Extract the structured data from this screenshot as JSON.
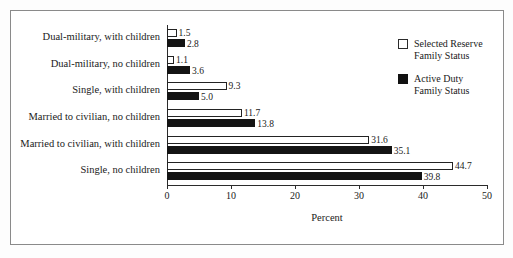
{
  "chart_data": {
    "type": "bar",
    "orientation": "horizontal",
    "title": "",
    "xlabel": "Percent",
    "ylabel": "",
    "xlim": [
      0,
      50
    ],
    "xticks": [
      "0",
      "10",
      "20",
      "30",
      "40",
      "50"
    ],
    "grid": false,
    "legend_position": "top-right",
    "categories": [
      "Dual-military, with children",
      "Dual-military, no children",
      "Single, with children",
      "Married to civilian, no children",
      "Married to civilian, with children",
      "Single, no children"
    ],
    "series": [
      {
        "name": "Selected Reserve Family Status",
        "style": "open",
        "values": [
          1.5,
          1.1,
          9.3,
          11.7,
          31.6,
          44.7
        ],
        "labels": [
          "1.5",
          "1.1",
          "9.3",
          "11.7",
          "31.6",
          "44.7"
        ]
      },
      {
        "name": "Active Duty Family Status",
        "style": "filled",
        "values": [
          2.8,
          3.6,
          5.0,
          13.8,
          35.1,
          39.8
        ],
        "labels": [
          "2.8",
          "3.6",
          "5.0",
          "13.8",
          "35.1",
          "39.8"
        ]
      }
    ]
  },
  "legend": {
    "entries": [
      {
        "line1": "Selected Reserve",
        "line2": "Family Status",
        "style": "open"
      },
      {
        "line1": "Active Duty",
        "line2": "Family Status",
        "style": "filled"
      }
    ]
  },
  "colors": {
    "reserve_fill": "#ffffff",
    "reserve_stroke": "#232323",
    "active_fill": "#141414",
    "axis": "#2b2b2b",
    "frame": "#8a8a8a",
    "background": "#ffffff"
  }
}
